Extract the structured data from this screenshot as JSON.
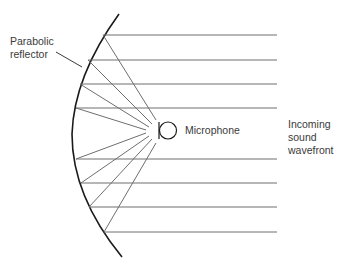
{
  "diagram": {
    "title": "Parabolic reflector microphone",
    "labels": {
      "reflector_line1": "Parabolic",
      "reflector_line2": "reflector",
      "microphone": "Microphone",
      "wavefront_line1": "Incoming",
      "wavefront_line2": "sound",
      "wavefront_line3": "wavefront"
    },
    "colors": {
      "reflector": "#1a1a1a",
      "rays": "#6e6e6e",
      "text": "#3a3a3a"
    },
    "focal_point": [
      150,
      128
    ],
    "incoming_rays_y": [
      35,
      60,
      84,
      108,
      159,
      183,
      207,
      232
    ],
    "ray_right_end_x": 277
  }
}
